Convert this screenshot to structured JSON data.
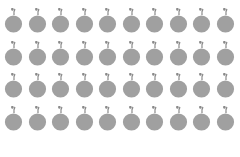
{
  "grid": {
    "rows": 4,
    "columns": 10,
    "item_icon": "apple-icon",
    "item_color": "#a0a0a0",
    "leaf_color": "#8a8a8a"
  },
  "caption": {
    "text": "4 × 10 = 40",
    "factor_a": "4",
    "factor_b": "10",
    "product": "40"
  }
}
